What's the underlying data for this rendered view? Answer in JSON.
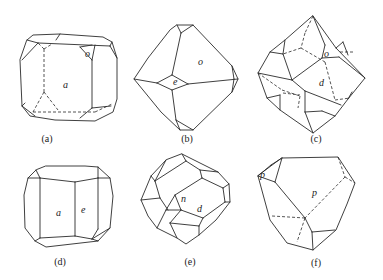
{
  "figure": {
    "type": "crystal habit line drawings",
    "panels": [
      {
        "id": "a",
        "caption": "(a)",
        "faces": [
          "a",
          "o"
        ]
      },
      {
        "id": "b",
        "caption": "(b)",
        "faces": [
          "o",
          "e"
        ]
      },
      {
        "id": "c",
        "caption": "(c)",
        "faces": [
          "o",
          "d"
        ]
      },
      {
        "id": "d",
        "caption": "(d)",
        "faces": [
          "a",
          "e"
        ]
      },
      {
        "id": "e",
        "caption": "(e)",
        "faces": [
          "n",
          "d"
        ]
      },
      {
        "id": "f",
        "caption": "(f)",
        "faces": [
          "p",
          "p"
        ]
      }
    ],
    "line_color": "#2a2a2a",
    "background": "#ffffff"
  }
}
